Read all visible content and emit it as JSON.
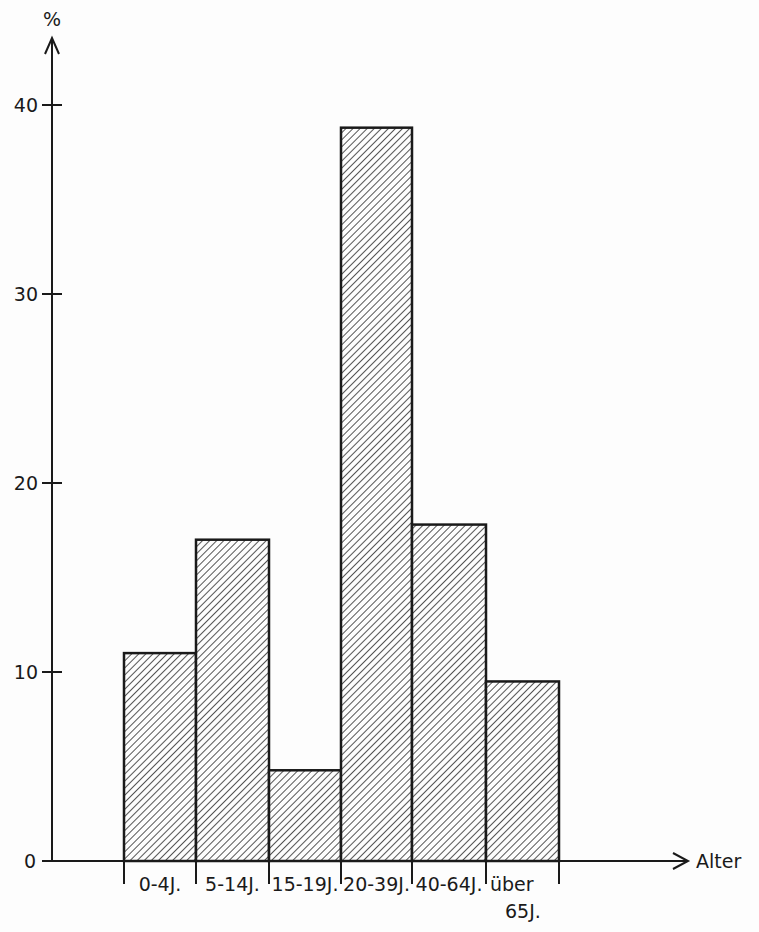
{
  "chart_data": {
    "type": "bar",
    "title": "",
    "xlabel": "Alter",
    "ylabel": "%",
    "categories": [
      "0-4J.",
      "5-14J.",
      "15-19J.",
      "20-39J.",
      "40-64J.",
      "über 65J."
    ],
    "category_lines": [
      [
        "0-4J."
      ],
      [
        "5-14J."
      ],
      [
        "15-19J."
      ],
      [
        "20-39J."
      ],
      [
        "40-64J."
      ],
      [
        "über",
        "65J."
      ]
    ],
    "values": [
      11,
      17,
      4.8,
      38.8,
      17.8,
      9.5
    ],
    "ylim": [
      0,
      40
    ],
    "yticks": [
      0,
      10,
      20,
      30,
      40
    ],
    "grid": false,
    "legend": null,
    "fill": "diagonal-hatch",
    "colors": {
      "ink": "#1a1a1a",
      "background": "#fdfdfd"
    }
  }
}
